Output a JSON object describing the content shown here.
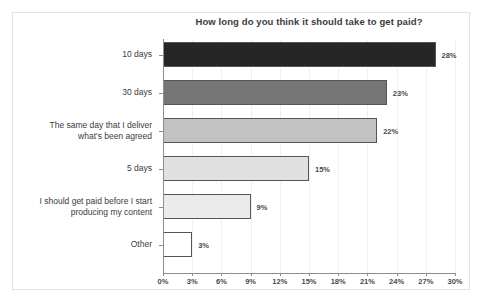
{
  "chart_data": {
    "type": "bar",
    "orientation": "horizontal",
    "title": "How long do you think it should take to get paid?",
    "xlabel": "",
    "ylabel": "",
    "xlim": [
      0,
      30
    ],
    "xtick_labels": [
      "0%",
      "3%",
      "6%",
      "9%",
      "12%",
      "15%",
      "18%",
      "21%",
      "24%",
      "27%",
      "30%"
    ],
    "xtick_values": [
      0,
      3,
      6,
      9,
      12,
      15,
      18,
      21,
      24,
      27,
      30
    ],
    "grid": true,
    "legend": "none",
    "categories": [
      "10 days",
      "30 days",
      "The same day that I deliver\nwhat's been agreed",
      "5 days",
      "I should get paid before I start\nproducing my content",
      "Other"
    ],
    "values": [
      28,
      23,
      22,
      15,
      9,
      3
    ],
    "value_labels": [
      "28%",
      "23%",
      "22%",
      "15%",
      "9%",
      "3%"
    ],
    "bar_colors": [
      "#262626",
      "#767676",
      "#c2c2c2",
      "#e0e0e0",
      "#ebebeb",
      "#ffffff"
    ],
    "bar_edge_color": "#555555",
    "axis_color": "#8d8d8d",
    "text_color": "#3b3b3b",
    "background_color": "#ffffff",
    "frame_color": "#e3e3e3"
  },
  "bars": [
    {
      "category_line1": "10 days",
      "category_line2": "",
      "value": 28,
      "label": "28%",
      "color": "#262626"
    },
    {
      "category_line1": "30 days",
      "category_line2": "",
      "value": 23,
      "label": "23%",
      "color": "#767676"
    },
    {
      "category_line1": "The same day that I deliver",
      "category_line2": "what's been agreed",
      "value": 22,
      "label": "22%",
      "color": "#c2c2c2"
    },
    {
      "category_line1": "5 days",
      "category_line2": "",
      "value": 15,
      "label": "15%",
      "color": "#e0e0e0"
    },
    {
      "category_line1": "I should get paid before I start",
      "category_line2": "producing my content",
      "value": 9,
      "label": "9%",
      "color": "#ebebeb"
    },
    {
      "category_line1": "Other",
      "category_line2": "",
      "value": 3,
      "label": "3%",
      "color": "#ffffff"
    }
  ],
  "xticks": [
    {
      "label": "0%",
      "value": 0
    },
    {
      "label": "3%",
      "value": 3
    },
    {
      "label": "6%",
      "value": 6
    },
    {
      "label": "9%",
      "value": 9
    },
    {
      "label": "12%",
      "value": 12
    },
    {
      "label": "15%",
      "value": 15
    },
    {
      "label": "18%",
      "value": 18
    },
    {
      "label": "21%",
      "value": 21
    },
    {
      "label": "24%",
      "value": 24
    },
    {
      "label": "27%",
      "value": 27
    },
    {
      "label": "30%",
      "value": 30
    }
  ]
}
